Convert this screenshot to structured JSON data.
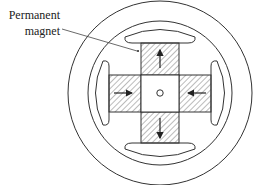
{
  "diagram": {
    "label": {
      "line1": "Permanent",
      "line2": "magnet"
    },
    "colors": {
      "stroke": "#333333",
      "hatch": "#555555",
      "background": "#ffffff"
    },
    "arrows": [
      {
        "position": "top",
        "direction": "up"
      },
      {
        "position": "bottom",
        "direction": "down"
      },
      {
        "position": "left",
        "direction": "right"
      },
      {
        "position": "right",
        "direction": "left"
      }
    ]
  }
}
